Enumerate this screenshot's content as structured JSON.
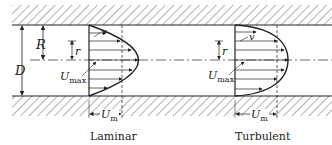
{
  "diagram": {
    "type": "pipe-flow-velocity-profiles",
    "labels": {
      "D": "D",
      "R": "R",
      "r_laminar": "r",
      "r_turbulent": "r",
      "v_laminar": "v",
      "v_turbulent": "v",
      "umax_laminar_main": "U",
      "umax_laminar_sub": "max",
      "umax_turbulent_main": "U",
      "umax_turbulent_sub": "max",
      "um_laminar_main": "U",
      "um_laminar_sub": "m",
      "um_turbulent_main": "U",
      "um_turbulent_sub": "m"
    },
    "captions": {
      "laminar": "Laminar",
      "turbulent": "Turbulent"
    }
  }
}
